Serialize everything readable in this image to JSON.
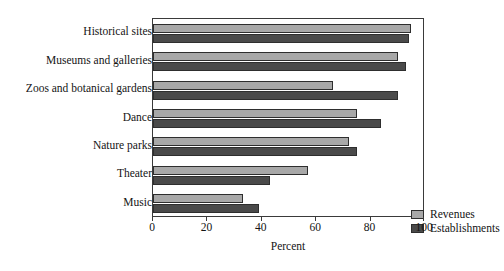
{
  "chart_data": {
    "type": "bar",
    "orientation": "horizontal",
    "title": "",
    "xlabel": "Percent",
    "ylabel": "",
    "xlim": [
      0,
      100
    ],
    "xticks": [
      0,
      20,
      40,
      60,
      80,
      100
    ],
    "grid": false,
    "legend_position": "lower-right-inside",
    "categories": [
      "Historical sites",
      "Museums and galleries",
      "Zoos and botanical gardens",
      "Dance",
      "Nature parks",
      "Theater",
      "Music"
    ],
    "series": [
      {
        "name": "Revenues",
        "color": "#a8a8a8",
        "values": [
          95,
          90,
          66,
          75,
          72,
          57,
          33
        ]
      },
      {
        "name": "Establishments",
        "color": "#4a4a4a",
        "values": [
          94,
          93,
          90,
          84,
          75,
          43,
          39
        ]
      }
    ]
  },
  "axes": {
    "x_axis_title": "Percent",
    "x_tick_labels": [
      "0",
      "20",
      "40",
      "60",
      "80",
      "100"
    ],
    "y_tick_labels": [
      "Historical sites",
      "Museums and galleries",
      "Zoos and botanical gardens",
      "Dance",
      "Nature parks",
      "Theater",
      "Music"
    ]
  },
  "legend": {
    "entries": [
      {
        "label": "Revenues",
        "swatch": "light-gray-swatch-icon"
      },
      {
        "label": "Establishments",
        "swatch": "dark-gray-swatch-icon"
      }
    ]
  },
  "artifacts": {
    "clipped_top_line": "· · · ·"
  }
}
